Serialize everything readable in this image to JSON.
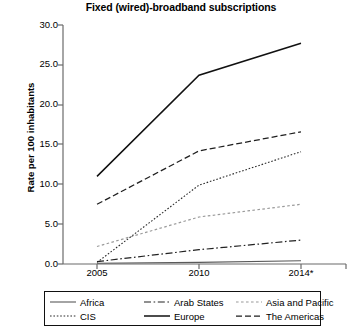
{
  "chart_data": {
    "type": "line",
    "title": "Fixed (wired)-broadband subscriptions",
    "xlabel": "",
    "ylabel": "Rate per 100 inhabitants",
    "x": [
      "2005",
      "2010",
      "2014*"
    ],
    "xtick_labels": [
      "2005",
      "2010",
      "2014*"
    ],
    "ytick_labels": [
      "0.0",
      "5.0",
      "10.0",
      "15.0",
      "20.0",
      "25.0",
      "30.0"
    ],
    "ytick_values": [
      0,
      5,
      10,
      15,
      20,
      25,
      30
    ],
    "ylim": [
      0,
      30
    ],
    "grid": false,
    "legend_position": "bottom",
    "series": [
      {
        "name": "Africa",
        "values": [
          0.1,
          0.2,
          0.4
        ],
        "style": "solid-thin",
        "color": "#5a5a5a"
      },
      {
        "name": "Arab States",
        "values": [
          0.3,
          1.8,
          3.0
        ],
        "style": "dash-dot",
        "color": "#222222"
      },
      {
        "name": "Asia and Pacific",
        "values": [
          2.2,
          5.9,
          7.5
        ],
        "style": "dotted-light",
        "color": "#9a9a9a"
      },
      {
        "name": "CIS",
        "values": [
          0.2,
          9.9,
          14.1
        ],
        "style": "dotted",
        "color": "#2b2b2b"
      },
      {
        "name": "Europe",
        "values": [
          11.0,
          23.7,
          27.7
        ],
        "style": "solid-thick",
        "color": "#111111"
      },
      {
        "name": "The Americas",
        "values": [
          7.5,
          14.2,
          16.6
        ],
        "style": "dashed",
        "color": "#1f1f1f"
      }
    ]
  },
  "legend": {
    "rows": [
      [
        {
          "label": "Africa",
          "style": "solid-thin"
        },
        {
          "label": "Arab States",
          "style": "dash-dot"
        },
        {
          "label": "Asia and Pacific",
          "style": "dotted-light"
        }
      ],
      [
        {
          "label": "CIS",
          "style": "dotted"
        },
        {
          "label": "Europe",
          "style": "solid-thick"
        },
        {
          "label": "The Americas",
          "style": "dashed"
        }
      ]
    ]
  },
  "axis": {
    "line_color": "#6b6b6b",
    "text_color": "#000000"
  }
}
